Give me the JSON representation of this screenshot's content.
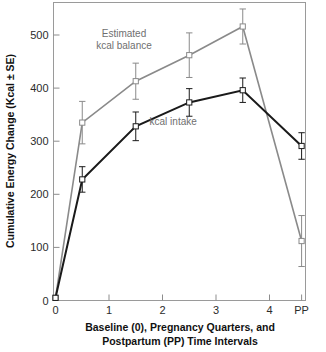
{
  "chart_data": {
    "type": "line",
    "title": "",
    "subtitle": "",
    "xlabel_line1": "Baseline (0), Pregnancy Quarters, and",
    "xlabel_line2": "Postpartum (PP) Time Intervals",
    "ylabel": "Cumulative Energy Change (Kcal ± SE)",
    "x": [
      0,
      0.5,
      1.5,
      2.5,
      3.5,
      4.6
    ],
    "xtick_values": [
      0,
      1,
      2,
      3,
      4,
      4.6
    ],
    "xtick_labels": [
      "0",
      "1",
      "2",
      "3",
      "4",
      "PP"
    ],
    "ytick_values": [
      0,
      100,
      200,
      300,
      400,
      500
    ],
    "ytick_labels": [
      "0",
      "100",
      "200",
      "300",
      "400",
      "500"
    ],
    "xlim": [
      -0.12,
      5.0
    ],
    "ylim": [
      0,
      560
    ],
    "grid": false,
    "legend_position": "inline-annotation",
    "series": [
      {
        "name": "Estimated kcal balance",
        "color": "#8a8a8a",
        "marker": "open-square",
        "values": [
          5,
          335,
          413,
          462,
          516,
          112
        ],
        "errors": [
          0,
          40,
          34,
          42,
          33,
          48
        ],
        "annotation": {
          "line1": "Estimated",
          "line2": "kcal balance",
          "x": 1.28,
          "y": 497
        }
      },
      {
        "name": "kcal intake",
        "color": "#1a1a1a",
        "marker": "open-square",
        "values": [
          5,
          228,
          328,
          373,
          396,
          291
        ],
        "errors": [
          0,
          24,
          27,
          26,
          23,
          25
        ],
        "annotation": {
          "line1": "kcal intake",
          "line2": "",
          "x": 2.2,
          "y": 330
        }
      }
    ]
  }
}
